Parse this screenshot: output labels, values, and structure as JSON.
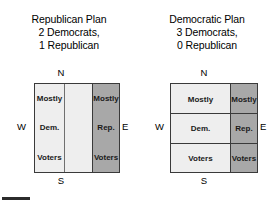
{
  "panels": [
    {
      "id": "republican-plan",
      "title": {
        "line1": "Republican Plan",
        "line2": "2 Democrats,",
        "line3": "1 Republican"
      },
      "compass": {
        "n": "N",
        "s": "S",
        "w": "W",
        "e": "E"
      },
      "map": {
        "layout": "vertical-districts",
        "districts": [
          {
            "id": "district-1",
            "fill": "#eeeeee",
            "party": "Democratic",
            "labels": [
              "Mostly",
              "Dem.",
              "Voters"
            ]
          },
          {
            "id": "district-2",
            "fill": "#eeeeee",
            "party": "Democratic",
            "labels": [
              "Mostly",
              "Dem.",
              "Voters"
            ]
          },
          {
            "id": "district-3",
            "fill": "#a8a8a8",
            "party": "Republican",
            "labels": [
              "Mostly",
              "Rep.",
              "Voters"
            ]
          }
        ]
      }
    },
    {
      "id": "democratic-plan",
      "title": {
        "line1": "Democratic Plan",
        "line2": "3 Democrats,",
        "line3": "0 Republican"
      },
      "compass": {
        "n": "N",
        "s": "S",
        "w": "W",
        "e": "E"
      },
      "map": {
        "layout": "horizontal-districts",
        "rows": [
          {
            "id": "district-1",
            "left_label": "Mostly",
            "right_label": "Mostly"
          },
          {
            "id": "district-2",
            "left_label": "Dem.",
            "right_label": "Rep."
          },
          {
            "id": "district-3",
            "left_label": "Voters",
            "right_label": "Voters"
          }
        ],
        "left_fill": "#eeeeee",
        "right_fill": "#a8a8a8"
      }
    }
  ],
  "colors": {
    "democratic_fill": "#eeeeee",
    "republican_fill": "#a8a8a8",
    "border": "#3a3a3a",
    "text": "#000000"
  }
}
